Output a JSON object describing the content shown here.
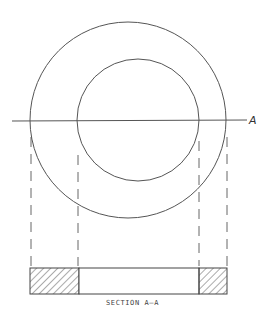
{
  "drawing": {
    "title": "Section view of an annular ring (washer)",
    "outer_circle": {
      "cx": 128,
      "cy": 120,
      "r": 98
    },
    "inner_circle": {
      "cx": 138,
      "cy": 120,
      "r": 61
    },
    "cutting_plane": {
      "x1": 12,
      "y1": 121,
      "x2": 247,
      "y2": 120,
      "label": "A"
    },
    "projection_lines": [
      {
        "x": 31,
        "y1": 137,
        "y2": 266
      },
      {
        "x": 78,
        "y1": 155,
        "y2": 266
      },
      {
        "x": 199,
        "y1": 141,
        "y2": 266
      },
      {
        "x": 227,
        "y1": 137,
        "y2": 266
      }
    ],
    "section": {
      "x": 30,
      "y": 268,
      "width": 197,
      "height": 26,
      "hatched_left": {
        "x": 30,
        "width": 49
      },
      "hatched_right": {
        "x": 199,
        "width": 28
      },
      "caption": "SECTION A–A"
    },
    "colors": {
      "line": "#555555",
      "hatch": "#444444",
      "background": "#ffffff"
    }
  }
}
